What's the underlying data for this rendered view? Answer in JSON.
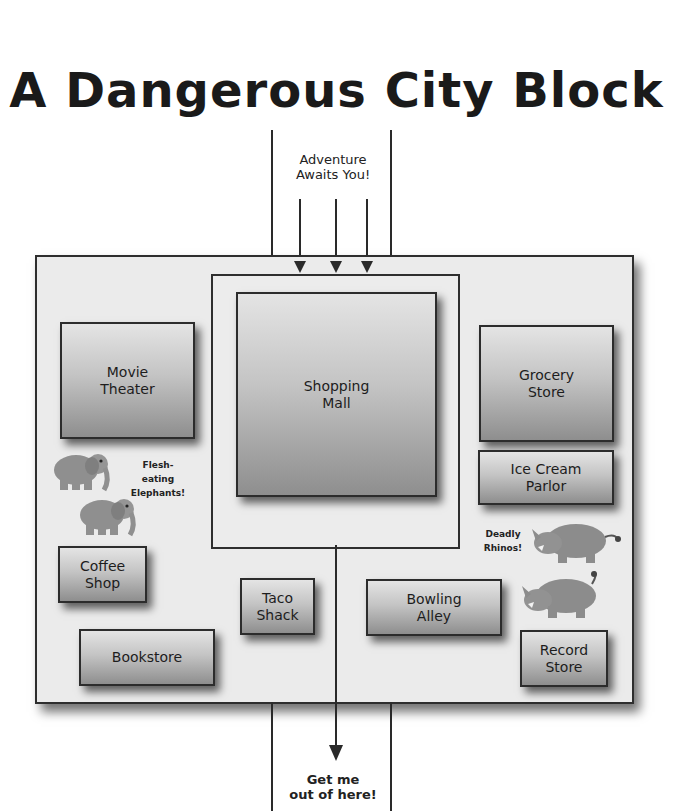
{
  "title": "A Dangerous City Block",
  "entrance_note": "Adventure\nAwaits You!",
  "exit_note": "Get me\nout of here!",
  "buildings": {
    "movie_theater": "Movie\nTheater",
    "shopping_mall": "Shopping\nMall",
    "grocery_store": "Grocery\nStore",
    "ice_cream_parlor": "Ice Cream\nParlor",
    "coffee_shop": "Coffee\nShop",
    "taco_shack": "Taco\nShack",
    "bowling_alley": "Bowling\nAlley",
    "bookstore": "Bookstore",
    "record_store": "Record\nStore"
  },
  "hazards": {
    "elephants": "Flesh-eating\nElephants!",
    "rhinos": "Deadly\nRhinos!"
  },
  "icons": {
    "elephant": "elephant-icon",
    "rhino": "rhino-icon"
  },
  "colors": {
    "line": "#2a2a2a",
    "block_fill": "#ebebeb",
    "building_top": "#e4e4e4",
    "building_bottom": "#8e8e8e",
    "animal": "#8a8a8a"
  }
}
